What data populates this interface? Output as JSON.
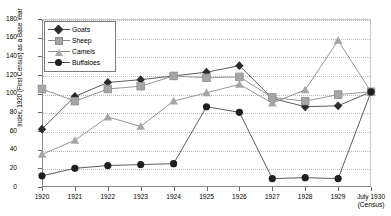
{
  "chart_data": {
    "type": "line",
    "title": "",
    "xlabel": "",
    "ylabel": "Index, 1920 (First Census) as a Base Year",
    "ylim": [
      0,
      180
    ],
    "ytick_step": 20,
    "yticks": [
      0,
      20,
      40,
      60,
      80,
      100,
      120,
      140,
      160,
      180
    ],
    "grid": true,
    "legend_position": "top-left",
    "categories": [
      "1920",
      "1921",
      "1922",
      "1923",
      "1924",
      "1925",
      "1926",
      "1927",
      "1928",
      "1929",
      "July 1930"
    ],
    "x_tick_labels": [
      {
        "main": "1920",
        "sub": ""
      },
      {
        "main": "1921",
        "sub": ""
      },
      {
        "main": "1922",
        "sub": ""
      },
      {
        "main": "1923",
        "sub": ""
      },
      {
        "main": "1924",
        "sub": ""
      },
      {
        "main": "1925",
        "sub": ""
      },
      {
        "main": "1926",
        "sub": ""
      },
      {
        "main": "1927",
        "sub": ""
      },
      {
        "main": "1928",
        "sub": ""
      },
      {
        "main": "1929",
        "sub": ""
      },
      {
        "main": "July 1930",
        "sub": "(Census)"
      }
    ],
    "series": [
      {
        "name": "Goats",
        "marker": "diamond",
        "color": "#2b2b2b",
        "line_color": "#4a4a4a",
        "values": [
          62,
          97,
          112,
          115,
          119,
          123,
          130,
          95,
          86,
          87,
          102
        ]
      },
      {
        "name": "Sheep",
        "marker": "square",
        "color": "#a6a6a6",
        "line_color": "#8a8a8a",
        "values": [
          105,
          92,
          105,
          108,
          119,
          117,
          118,
          96,
          92,
          99,
          102
        ]
      },
      {
        "name": "Camels",
        "marker": "triangle",
        "color": "#a6a6a6",
        "line_color": "#8a8a8a",
        "values": [
          35,
          50,
          75,
          65,
          92,
          101,
          110,
          90,
          104,
          157,
          102
        ]
      },
      {
        "name": "Buffaloes",
        "marker": "circle",
        "color": "#1f1f1f",
        "line_color": "#4a4a4a",
        "values": [
          12,
          20,
          23,
          24,
          25,
          86,
          80,
          9,
          10,
          9,
          102
        ]
      }
    ]
  },
  "legend": {
    "items": [
      {
        "label": "Goats"
      },
      {
        "label": "Sheep"
      },
      {
        "label": "Camels"
      },
      {
        "label": "Buffaloes"
      }
    ]
  }
}
